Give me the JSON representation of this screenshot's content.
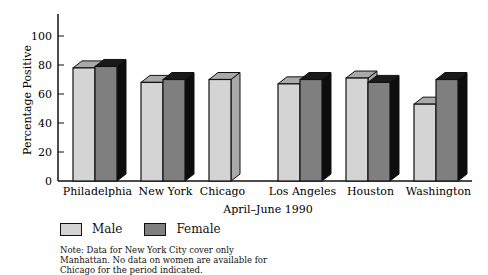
{
  "chart_data": {
    "type": "bar",
    "style": "3d-grouped",
    "title": "",
    "xlabel": "April–June 1990",
    "ylabel": "Percentage Positive",
    "ylim": [
      0,
      110
    ],
    "yticks": [
      0,
      20,
      40,
      60,
      80,
      100
    ],
    "grid": false,
    "legend_position": "bottom-left",
    "categories": [
      "Philadelphia",
      "New York",
      "Chicago",
      "Los Angeles",
      "Houston",
      "Washington"
    ],
    "series": [
      {
        "name": "Male",
        "color": "#d4d4d4",
        "values": [
          78,
          68,
          70,
          67,
          71,
          53
        ]
      },
      {
        "name": "Female",
        "color": "#7f7f7f",
        "values": [
          79,
          70,
          null,
          70,
          68,
          70
        ]
      }
    ],
    "note": "Note: Data for New York City cover only Manhattan. No data on women are available for Chicago for the period indicated."
  },
  "legend": {
    "items": [
      {
        "label": "Male",
        "color": "#d4d4d4"
      },
      {
        "label": "Female",
        "color": "#7f7f7f"
      }
    ]
  },
  "note_lines": [
    "Note: Data for New York City cover only",
    "Manhattan. No data on women are available for",
    "Chicago for the period indicated."
  ]
}
